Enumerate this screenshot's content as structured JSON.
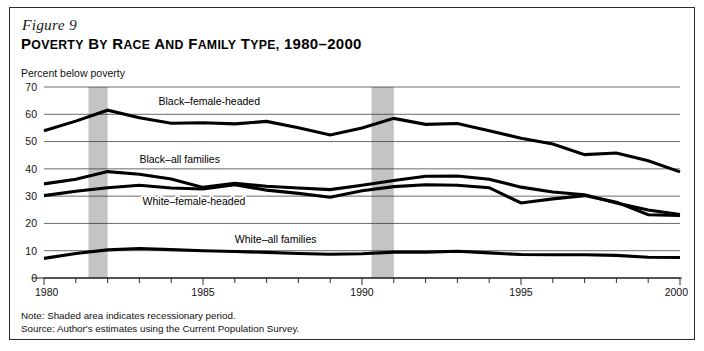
{
  "figure": {
    "number": "Figure 9",
    "title": "POVERTY BY RACE AND FAMILY TYPE, 1980–2000",
    "title_caps": "P",
    "axis_note": "Percent below poverty",
    "note_line": "Note: Shaded area indicates recessionary period.",
    "source_line": "Source: Author's estimates using the Current Population Survey."
  },
  "colors": {
    "line": "#000000",
    "grid": "#2a2a2a",
    "recession_band": "#c4c4c4",
    "frame": "#2b2b2b",
    "background": "#ffffff"
  },
  "chart_data": {
    "type": "line",
    "title": "Poverty by Race and Family Type, 1980–2000",
    "xlabel": "",
    "ylabel": "Percent below poverty",
    "xlim": [
      1980,
      2000
    ],
    "ylim": [
      0,
      70
    ],
    "yticks": [
      0,
      10,
      20,
      30,
      40,
      50,
      60,
      70
    ],
    "xticks_labeled": [
      1980,
      1985,
      1990,
      1995,
      2000
    ],
    "xticks_minor": [
      1981,
      1982,
      1983,
      1984,
      1986,
      1987,
      1988,
      1989,
      1991,
      1992,
      1993,
      1994,
      1996,
      1997,
      1998,
      1999
    ],
    "grid": "horizontal",
    "legend": "inline-labels",
    "x": [
      1980,
      1981,
      1982,
      1983,
      1984,
      1985,
      1986,
      1987,
      1988,
      1989,
      1990,
      1991,
      1992,
      1993,
      1994,
      1995,
      1996,
      1997,
      1998,
      1999,
      2000
    ],
    "series": [
      {
        "name": "Black–female-headed",
        "label": "Black–female-headed",
        "values": [
          54.0,
          57.5,
          61.5,
          58.7,
          56.7,
          56.9,
          56.5,
          57.4,
          55.1,
          52.4,
          55.0,
          58.5,
          56.3,
          56.6,
          54.0,
          51.2,
          49.1,
          45.2,
          45.8,
          43.0,
          38.9
        ]
      },
      {
        "name": "Black–all families",
        "label": "Black–all families",
        "values": [
          34.5,
          36.2,
          39.0,
          38.0,
          36.3,
          33.2,
          34.7,
          33.6,
          33.0,
          32.4,
          34.0,
          35.7,
          37.3,
          37.4,
          36.2,
          33.3,
          31.5,
          30.5,
          27.5,
          24.9,
          23.3
        ]
      },
      {
        "name": "White–female-headed",
        "label": "White–female-headed",
        "values": [
          30.2,
          31.8,
          33.1,
          34.0,
          33.0,
          32.6,
          34.2,
          32.2,
          31.0,
          29.6,
          32.0,
          33.5,
          34.2,
          34.0,
          33.1,
          27.5,
          29.0,
          30.2,
          27.8,
          23.2,
          22.9
        ]
      },
      {
        "name": "White–all families",
        "label": "White–all families",
        "values": [
          7.2,
          9.0,
          10.3,
          10.8,
          10.4,
          10.0,
          9.7,
          9.4,
          9.0,
          8.7,
          8.9,
          9.5,
          9.5,
          9.8,
          9.2,
          8.6,
          8.5,
          8.5,
          8.3,
          7.6,
          7.5
        ]
      }
    ],
    "recessions": [
      {
        "start": 1981.4,
        "end": 1982.0,
        "label": "recessionary period"
      },
      {
        "start": 1990.3,
        "end": 1991.0,
        "label": "recessionary period"
      }
    ],
    "series_label_positions": [
      {
        "name": "Black–female-headed",
        "x": 1983.6,
        "y": 63.5
      },
      {
        "name": "Black–all families",
        "x": 1983.0,
        "y": 42.3
      },
      {
        "name": "White–female-headed",
        "x": 1983.1,
        "y": 26.7
      },
      {
        "name": "White–all families",
        "x": 1986.0,
        "y": 13.0
      }
    ]
  }
}
